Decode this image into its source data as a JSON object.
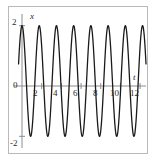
{
  "chart_data": {
    "type": "line",
    "title": "",
    "xlabel": "t",
    "ylabel": "x",
    "xlim": [
      -0.35,
      12.6
    ],
    "ylim": [
      -2.35,
      2.35
    ],
    "grid": false,
    "legend": null,
    "amplitude": 2,
    "period": 1.75,
    "function": "x = 2 cos(2*pi*t/1.75)",
    "xticks": [
      2,
      4,
      6,
      8,
      10,
      12
    ],
    "xticklabels": [
      "2",
      "4",
      "6",
      "8",
      "10",
      "12"
    ],
    "yticks": [
      -2,
      0,
      2
    ],
    "yticklabels": [
      "-2",
      "0",
      "2"
    ],
    "series": [
      {
        "name": "x(t)",
        "color": "#1a1a1a",
        "linewidth": 1.3,
        "x": [
          0,
          0.4375,
          0.875,
          1.3125,
          1.75,
          2.1875,
          2.625,
          3.0625,
          3.5,
          3.9375,
          4.375,
          4.8125,
          5.25,
          5.6875,
          6.125,
          6.5625,
          7,
          7.4375,
          7.875,
          8.3125,
          8.75,
          9.1875,
          9.625,
          10.0625,
          10.5,
          10.9375,
          11.375,
          11.8125,
          12.25
        ],
        "values": [
          2,
          0,
          -2,
          0,
          2,
          0,
          -2,
          0,
          2,
          0,
          -2,
          0,
          2,
          0,
          -2,
          0,
          2,
          0,
          -2,
          0,
          2,
          0,
          -2,
          0,
          2,
          0,
          -2,
          0,
          2
        ]
      }
    ],
    "peaks_t": [
      0,
      1.75,
      3.5,
      5.25,
      7,
      8.75,
      10.5,
      12.25
    ],
    "troughs_t": [
      0.875,
      2.625,
      4.375,
      6.125,
      7.875,
      9.625,
      11.375
    ],
    "peak_value": 2,
    "trough_value": -2,
    "cycles_shown": 7
  },
  "labels": {
    "y_top": "2",
    "y_zero": "0",
    "y_bottom": "-2",
    "x_2": "2",
    "x_4": "4",
    "x_6": "6",
    "x_8": "8",
    "x_10": "10",
    "x_12": "12",
    "axis_x_name": "x",
    "axis_t_name": "t"
  },
  "colors": {
    "curve": "#1a1a1a",
    "axis": "#8d8d92",
    "frame": "#b9b9bd",
    "background": "#ffffff",
    "text": "#2a2a2a"
  }
}
